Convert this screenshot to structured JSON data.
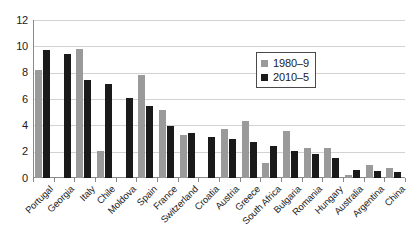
{
  "chart_data": {
    "type": "bar",
    "title": "",
    "subtitle": "",
    "xlabel": "",
    "ylabel": "",
    "ylim": [
      0,
      12
    ],
    "yticks": [
      0,
      2,
      4,
      6,
      8,
      10,
      12
    ],
    "grid": true,
    "legend_position": "inside-top-right",
    "categories": [
      "Portugal",
      "Georgia",
      "Italy",
      "Chile",
      "Moldova",
      "Spain",
      "France",
      "Switzerland",
      "Croatia",
      "Austria",
      "Greece",
      "South Africa",
      "Bulgaria",
      "Romania",
      "Hungary",
      "Australia",
      "Argentina",
      "China"
    ],
    "series": [
      {
        "name": "1980–9",
        "color": "#9a9a9a",
        "values": [
          8.2,
          0,
          9.8,
          2.05,
          0,
          7.85,
          5.2,
          3.3,
          0,
          3.7,
          4.35,
          1.15,
          3.6,
          2.3,
          2.3,
          0.25,
          1.0,
          0.75
        ]
      },
      {
        "name": "2010–5",
        "color": "#1a1a1a",
        "values": [
          9.7,
          9.4,
          7.45,
          7.15,
          6.1,
          5.5,
          3.95,
          3.4,
          3.1,
          3.0,
          2.75,
          2.4,
          2.05,
          1.85,
          1.55,
          0.6,
          0.55,
          0.45
        ]
      }
    ]
  },
  "legend": {
    "items": [
      {
        "label": "1980–9"
      },
      {
        "label": "2010–5"
      }
    ]
  }
}
